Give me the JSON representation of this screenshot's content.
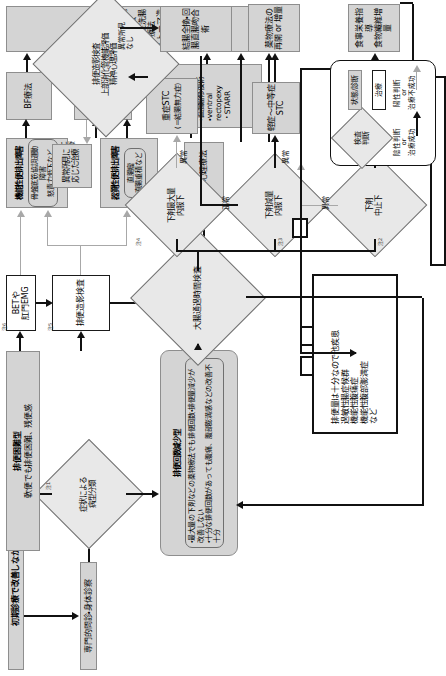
{
  "diagram": {
    "legend": {
      "name": "凡例",
      "shapes": [
        {
          "id": "test",
          "label": "検査\n判断",
          "shape": "diamond"
        },
        {
          "id": "state",
          "label": "状態/診断",
          "shape": "gray-box"
        },
        {
          "id": "treatment",
          "label": "治療",
          "shape": "white-box"
        }
      ],
      "arrows": [
        {
          "id": "negative",
          "label": "陰性判断\nor\n治療成功",
          "style": "solid-black"
        },
        {
          "id": "positive",
          "label": "陽性判断\nor\n治療不成功",
          "style": "solid-gray"
        }
      ]
    },
    "nodes": {
      "entry_patient": "初期診療で改善しなかった慢性便秘症患者",
      "specialist_exam": "専門的問診・身体診察",
      "symptom_classification": "症状による\n病型分類",
      "note1": "注1",
      "note2": "注2",
      "note3": "注3",
      "note4": "注4",
      "note5": "注5",
      "note6": "注6",
      "difficult_defecation_type": "排便困難型",
      "difficult_defecation_desc": "軟便でも排便困難、残便感",
      "bet_emg": "BETや\n肛門EMG",
      "defecography": "排便造影検査",
      "functional_outlet_title": "機能性便排出障害",
      "functional_outlet_items": "骨盤底筋協調運動障害\n怒責力低下など",
      "organic_outlet_title": "器質性便排出障害",
      "organic_outlet_items": "直腸瘤\n直腸重積など",
      "dyssynergic_defecation": "排便強迫神経症",
      "psych_therapy": "精神・心理療法",
      "bf_therapy": "BF療法",
      "drug_therapy": "薬物療法\n坐薬・浣腸",
      "surgery_box": "病態に応じて\n手術を検討\n・直腸瘤修復術\n・ventral rectopexy\n・STARR",
      "irrigation_box": "経肛門的洗腸療法\n順行性洗腸療法\nストーマ造設術",
      "reduced_frequency_type": "排便回数減少型",
      "reduced_frequency_desc": "・最大量の下剤などの薬物療法でも排便回数・排便量減少が改善しない\n・十分な排便回数があっても腹痛、腹部膨満感などの改善不十分",
      "colonic_transit_test": "大腸通過時間検査",
      "laxative_stop": "下剤\n中止下",
      "laxative_reduced": "下剤減量\n内服下",
      "laxative_max": "下剤最大量\n内服下",
      "ntc": "NTC",
      "stc_mild": "軽症～中等症\nSTC",
      "stc_severe": "重症STC",
      "stc_severe_sub": "(＝結腸無力症)",
      "diet_guidance": "食事栄養指導\n食物繊維増量",
      "drug_resume": "薬物療法の\n再開 or 増量",
      "further_tests": "排便造影検査\n上部消化管機能評価\n精神心理評価",
      "colectomy": "結腸全摘・回腸直腸吻合術",
      "other_diseases": "排便量は十分なので他疾患\n過敏性腸症候群\n機能性腹痛症\n機能性腹部膨満症\nなど"
    },
    "edge_labels": {
      "abnormal": "異常",
      "normal": "正常",
      "abnormal_findings": "異常所見",
      "no_findings": "なし",
      "abnormal_findings_none": "異常所見\nなし",
      "abnormal_findings_treat": "異常所見に\n応じた治療",
      "abnormal_short": "異常",
      "normal_short": "正常"
    },
    "colors": {
      "state_fill": "#d4d4d4",
      "state_stroke": "#8e8e8e",
      "treat_fill": "#ffffff",
      "treat_stroke": "#1a1a1a",
      "arrow_black": "#111111",
      "arrow_gray": "#a8a8a8",
      "diamond_fill": "#e8e8e8"
    }
  }
}
